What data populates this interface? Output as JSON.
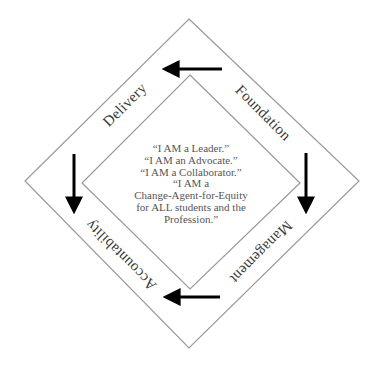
{
  "diagram": {
    "type": "nested-diamond-cycle",
    "outer_diamond": {
      "top": [
        189,
        19
      ],
      "right": [
        359,
        181
      ],
      "bottom": [
        189,
        348
      ],
      "left": [
        25,
        181
      ],
      "stroke": "#999999"
    },
    "inner_diamond": {
      "top": [
        190,
        75
      ],
      "right": [
        300,
        183
      ],
      "bottom": [
        190,
        289
      ],
      "left": [
        82,
        183
      ],
      "stroke": "#999999"
    },
    "labels": {
      "delivery": "Delivery",
      "foundation": "Foundation",
      "management": "Management",
      "accountability": "Accountability"
    },
    "center_lines": [
      "“I AM a Leader.”",
      "“I AM an Advocate.”",
      "“I AM a Collaborator.”",
      "“I AM a",
      "Change-Agent-for-Equity",
      "for ALL students and the",
      "Profession.”"
    ],
    "arrows": [
      {
        "name": "top",
        "from": [
          222,
          69
        ],
        "to": [
          163,
          69
        ],
        "direction": "left"
      },
      {
        "name": "right",
        "from": [
          306,
          153
        ],
        "to": [
          306,
          213
        ],
        "direction": "down"
      },
      {
        "name": "bottom",
        "from": [
          220,
          297
        ],
        "to": [
          164,
          297
        ],
        "direction": "left"
      },
      {
        "name": "left",
        "from": [
          74,
          154
        ],
        "to": [
          74,
          213
        ],
        "direction": "down"
      }
    ],
    "colors": {
      "arrow": "#000000",
      "label_text": "#3a3a3a",
      "center_text": "#555555",
      "diamond_stroke": "#999999"
    }
  }
}
